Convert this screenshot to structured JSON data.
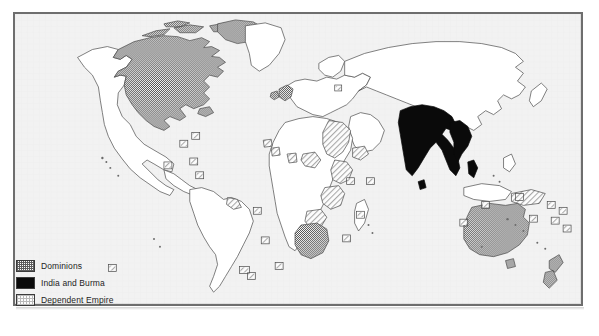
{
  "figure": {
    "kind": "historical-world-map",
    "background_color": "#ffffff",
    "frame_border_color": "#6e6e6e",
    "ocean_color": "#f2f2f2",
    "land_color": "#ffffff",
    "coastline_color": "#4a4a4a"
  },
  "legend": {
    "items": [
      {
        "label": "Dominions",
        "swatch": "dominions-swatch",
        "pattern": "dark-checker",
        "color": "#5e5e5e"
      },
      {
        "label": "India and Burma",
        "swatch": "india-swatch",
        "pattern": "solid",
        "color": "#0a0a0a"
      },
      {
        "label": "Dependent Empire",
        "swatch": "dependent-swatch",
        "pattern": "light-hatch",
        "color": "#b9b9b9"
      }
    ]
  },
  "regions": {
    "dominions": [
      "Canada",
      "Newfoundland",
      "United Kingdom",
      "Ireland",
      "Union of South Africa",
      "Australia",
      "New Zealand"
    ],
    "india_and_burma": [
      "India",
      "Burma",
      "Ceylon"
    ],
    "dependent_empire": [
      "Egypt and Sudan",
      "British East Africa",
      "Nyasaland",
      "Northern Rhodesia",
      "Southern Rhodesia",
      "Bechuanaland",
      "Nigeria",
      "Gold Coast",
      "Sierra Leone",
      "Gambia",
      "Somaliland",
      "Malaya",
      "Papua",
      "Guyana"
    ]
  },
  "island_markers": {
    "note": "small boxed squares denote island dependencies",
    "count": 24
  }
}
